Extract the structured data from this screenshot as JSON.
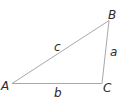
{
  "diagram": {
    "type": "triangle",
    "vertices": [
      {
        "name": "A",
        "label": "A"
      },
      {
        "name": "B",
        "label": "B"
      },
      {
        "name": "C",
        "label": "C"
      }
    ],
    "sides": [
      {
        "name": "a",
        "label": "a",
        "between": "B-C"
      },
      {
        "name": "b",
        "label": "b",
        "between": "A-C"
      },
      {
        "name": "c",
        "label": "c",
        "between": "A-B"
      }
    ],
    "colors": {
      "edge": "#a8a8a8",
      "label": "#2a2a2a"
    }
  }
}
